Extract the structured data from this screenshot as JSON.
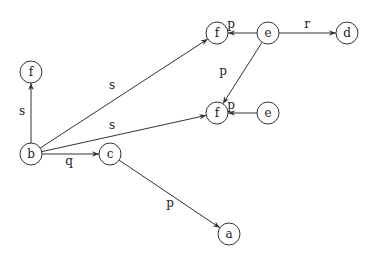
{
  "diagram": {
    "type": "directed-graph",
    "nodes": [
      {
        "id": "n_f1",
        "label": "f",
        "x": 31,
        "y": 72
      },
      {
        "id": "n_b",
        "label": "b",
        "x": 31,
        "y": 154
      },
      {
        "id": "n_c",
        "label": "c",
        "x": 110,
        "y": 154
      },
      {
        "id": "n_a",
        "label": "a",
        "x": 229,
        "y": 234
      },
      {
        "id": "n_f2",
        "label": "f",
        "x": 217,
        "y": 33
      },
      {
        "id": "n_e1",
        "label": "e",
        "x": 268,
        "y": 33
      },
      {
        "id": "n_d",
        "label": "d",
        "x": 347,
        "y": 33
      },
      {
        "id": "n_f3",
        "label": "f",
        "x": 217,
        "y": 113
      },
      {
        "id": "n_e2",
        "label": "e",
        "x": 268,
        "y": 113
      }
    ],
    "edges": [
      {
        "from": "n_b",
        "to": "n_f1",
        "label": "s",
        "lx": 22,
        "ly": 111
      },
      {
        "from": "n_b",
        "to": "n_f2",
        "label": "s",
        "lx": 112,
        "ly": 85
      },
      {
        "from": "n_b",
        "to": "n_f3",
        "label": "s",
        "lx": 112,
        "ly": 125
      },
      {
        "from": "n_b",
        "to": "n_c",
        "label": "q",
        "lx": 69,
        "ly": 161
      },
      {
        "from": "n_c",
        "to": "n_a",
        "label": "p",
        "lx": 170,
        "ly": 203
      },
      {
        "from": "n_e1",
        "to": "n_f2",
        "label": "p",
        "lx": 231,
        "ly": 24
      },
      {
        "from": "n_e1",
        "to": "n_d",
        "label": "r",
        "lx": 307,
        "ly": 24
      },
      {
        "from": "n_e1",
        "to": "n_f3",
        "label": "p",
        "lx": 223,
        "ly": 71
      },
      {
        "from": "n_e2",
        "to": "n_f3",
        "label": "p",
        "lx": 231,
        "ly": 105
      }
    ],
    "node_radius": 11,
    "colors": {
      "stroke": "#333333",
      "text": "#222222",
      "background": "#ffffff"
    }
  }
}
